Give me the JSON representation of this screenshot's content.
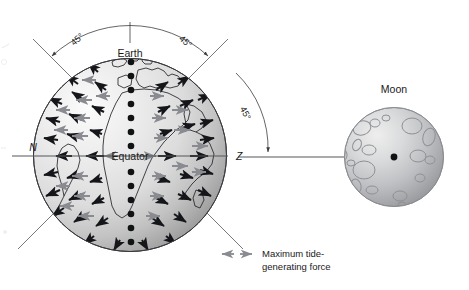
{
  "figure": {
    "background_color": "#ffffff"
  },
  "earth": {
    "label": "Earth",
    "equator_label": "Equator",
    "north_axis_label": "N",
    "zenith_axis_label": "Z",
    "center_px": [
      130,
      155
    ],
    "radius_px": 97,
    "fill_light": "#f2f2f2",
    "fill_dark": "#9a9a9a",
    "meridian_dot_color": "#111214"
  },
  "moon": {
    "label": "Moon",
    "center_px": [
      394,
      157
    ],
    "radius_px": 50,
    "fill_light": "#e8e8e8",
    "fill_dark": "#8f9094",
    "center_dot_color": "#111214",
    "crater_color": "#8e9095"
  },
  "angles": [
    {
      "id": "left",
      "label": "45°"
    },
    {
      "id": "right",
      "label": "45°"
    },
    {
      "id": "lower-right",
      "label": "45°"
    }
  ],
  "legend": {
    "line1": "Maximum tide-",
    "line2": "generating force",
    "arrow_color": "#8a8b90",
    "arrow_left_name": "legend-arrow-left",
    "arrow_right_name": "legend-arrow-right"
  },
  "arrows": {
    "black_color": "#15161a",
    "gray_color": "#8a8b90",
    "black_description": "tide-generating force vectors",
    "gray_description": "maximum tide-generating force vectors"
  },
  "colors": {
    "ink": "#1a1a1a",
    "line": "#55565a",
    "accent_gray": "#8a8b90"
  }
}
